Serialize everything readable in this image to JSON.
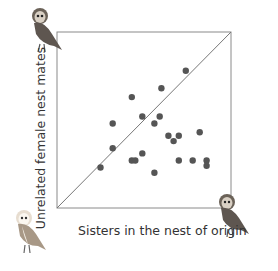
{
  "chart_data": {
    "type": "scatter",
    "title": "",
    "xlabel": "Sisters in the nest of origin",
    "ylabel": "Unrelated female nest mates",
    "xlim": [
      0,
      1
    ],
    "ylim": [
      0,
      1
    ],
    "grid": false,
    "legend": null,
    "reference_line": {
      "type": "diagonal",
      "label": "y = x",
      "from": [
        0,
        0
      ],
      "to": [
        1,
        1
      ]
    },
    "annotations": [
      {
        "type": "owl-illustration",
        "position": "top-left, above y-axis",
        "color": "dark"
      },
      {
        "type": "owl-illustration",
        "position": "bottom-left, below y-axis",
        "color": "light"
      },
      {
        "type": "owl-illustration",
        "position": "bottom-right, beside x-axis end",
        "color": "dark"
      }
    ],
    "points": [
      {
        "x": 0.74,
        "y": 0.78
      },
      {
        "x": 0.6,
        "y": 0.68
      },
      {
        "x": 0.43,
        "y": 0.63
      },
      {
        "x": 0.32,
        "y": 0.48
      },
      {
        "x": 0.49,
        "y": 0.52
      },
      {
        "x": 0.59,
        "y": 0.52
      },
      {
        "x": 0.56,
        "y": 0.48
      },
      {
        "x": 0.64,
        "y": 0.41
      },
      {
        "x": 0.7,
        "y": 0.41
      },
      {
        "x": 0.67,
        "y": 0.38
      },
      {
        "x": 0.82,
        "y": 0.43
      },
      {
        "x": 0.32,
        "y": 0.34
      },
      {
        "x": 0.43,
        "y": 0.27
      },
      {
        "x": 0.45,
        "y": 0.27
      },
      {
        "x": 0.49,
        "y": 0.31
      },
      {
        "x": 0.7,
        "y": 0.27
      },
      {
        "x": 0.78,
        "y": 0.27
      },
      {
        "x": 0.86,
        "y": 0.27
      },
      {
        "x": 0.86,
        "y": 0.24
      },
      {
        "x": 0.56,
        "y": 0.2
      },
      {
        "x": 0.25,
        "y": 0.23
      }
    ],
    "colors": {
      "point": "#555555",
      "frame": "#888888",
      "diagonal": "#777777"
    }
  }
}
